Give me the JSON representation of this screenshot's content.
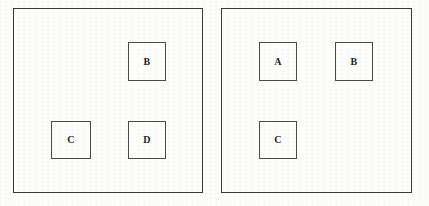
{
  "figure": {
    "background_color": "#fdfdfc",
    "frame_color": "#3a3a3c",
    "box_border_color": "#4a4a4d",
    "label_color": "#1d1d1f"
  },
  "panels": [
    {
      "name": "left-panel",
      "frame": {
        "x": 13,
        "y": 8,
        "width": 190,
        "height": 185
      },
      "boxes": [
        {
          "label": "B",
          "slot": "top-right",
          "x": 127,
          "y": 41,
          "width": 38,
          "height": 39
        },
        {
          "label": "C",
          "slot": "bottom-left",
          "x": 50,
          "y": 120,
          "width": 40,
          "height": 38
        },
        {
          "label": "D",
          "slot": "bottom-right",
          "x": 127,
          "y": 120,
          "width": 38,
          "height": 38
        }
      ]
    },
    {
      "name": "right-panel",
      "frame": {
        "x": 221,
        "y": 8,
        "width": 191,
        "height": 185
      },
      "boxes": [
        {
          "label": "A",
          "slot": "top-left",
          "x": 258,
          "y": 41,
          "width": 38,
          "height": 39
        },
        {
          "label": "B",
          "slot": "top-right",
          "x": 334,
          "y": 41,
          "width": 38,
          "height": 39
        },
        {
          "label": "C",
          "slot": "bottom-left",
          "x": 258,
          "y": 120,
          "width": 38,
          "height": 38
        }
      ]
    }
  ]
}
